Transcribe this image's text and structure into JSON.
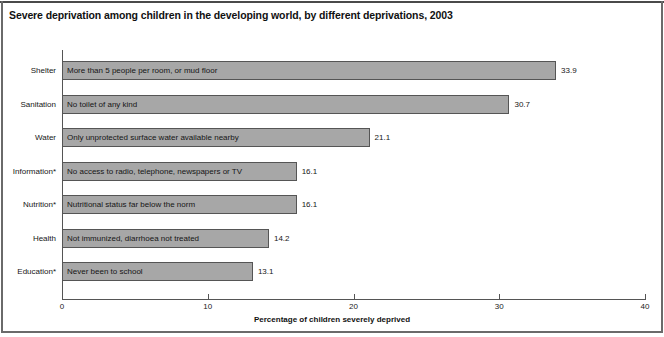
{
  "chart_data": {
    "type": "bar",
    "orientation": "horizontal",
    "title": "Severe deprivation among children in the developing world, by different deprivations, 2003",
    "xlabel": "Percentage of children severely deprived",
    "ylabel": "",
    "xlim": [
      0,
      40
    ],
    "xticks": [
      0,
      10,
      20,
      30,
      40
    ],
    "xtick_labels": [
      "0",
      "10",
      "20",
      "30",
      "40"
    ],
    "grid": false,
    "legend": null,
    "bar_color": "#a7a7a7",
    "bar_border_color": "#555555",
    "categories": [
      "Shelter",
      "Sanitation",
      "Water",
      "Information*",
      "Nutrition*",
      "Health",
      "Education*"
    ],
    "values": [
      33.9,
      30.7,
      21.1,
      16.1,
      16.1,
      14.2,
      13.1
    ],
    "value_labels": [
      "33.9",
      "30.7",
      "21.1",
      "16.1",
      "16.1",
      "14.2",
      "13.1"
    ],
    "bar_descriptions": [
      "More than 5 people per room, or mud floor",
      "No toilet of any kind",
      "Only unprotected surface water available nearby",
      "No access to radio, telephone, newspapers or TV",
      "Nutritional status far below the norm",
      "Not immunized, diarrhoea not treated",
      "Never been to school"
    ]
  }
}
